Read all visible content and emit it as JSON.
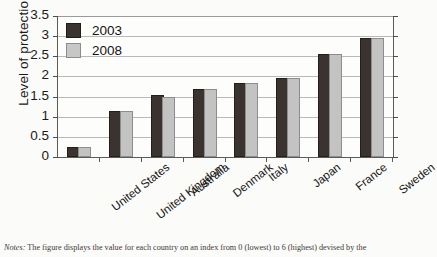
{
  "chart_data": {
    "type": "bar",
    "title": "",
    "xlabel": "",
    "ylabel": "Level of protection",
    "ylim": [
      0,
      3.5
    ],
    "yticks": [
      "0",
      "0.5",
      "1",
      "1.5",
      "2",
      "2.5",
      "3",
      "3.5"
    ],
    "grid": true,
    "legend_position": "top-left",
    "categories": [
      "United States",
      "United Kingdom",
      "Australia",
      "Denmark",
      "Italy",
      "Japan",
      "France",
      "Sweden"
    ],
    "series": [
      {
        "name": "2003",
        "color": "#3b3330",
        "values": [
          0.2,
          1.1,
          1.5,
          1.65,
          1.8,
          1.9,
          2.5,
          2.9
        ]
      },
      {
        "name": "2008",
        "color": "#c3c3c3",
        "values": [
          0.2,
          1.1,
          1.45,
          1.65,
          1.8,
          1.9,
          2.5,
          2.9
        ]
      }
    ]
  },
  "legend": {
    "items": [
      {
        "label": "2003"
      },
      {
        "label": "2008"
      }
    ]
  },
  "notes": {
    "prefix": "Notes:",
    "text": "The figure displays the value for each country on an index from 0 (lowest) to 6 (highest) devised by the"
  }
}
